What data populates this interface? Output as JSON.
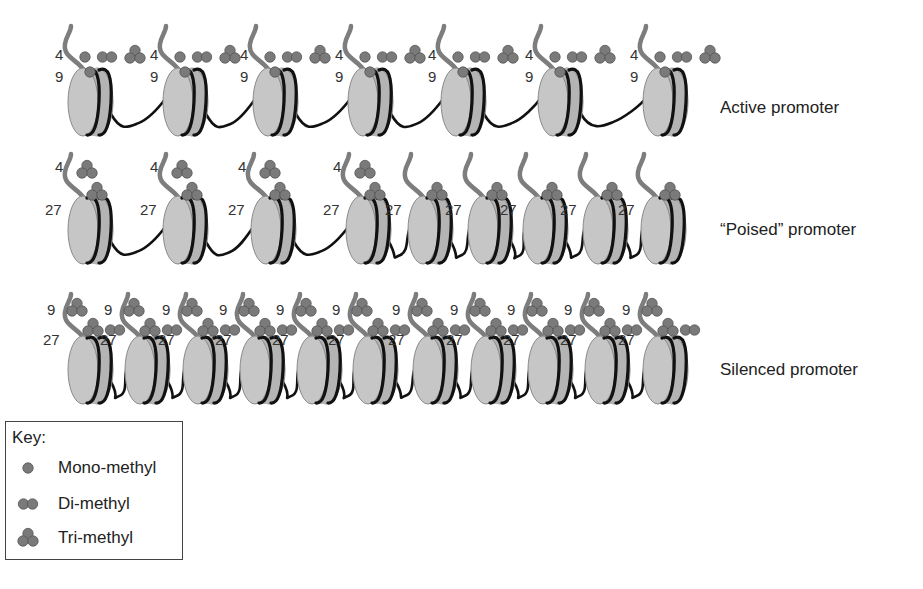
{
  "figure": {
    "colors": {
      "histone_fill": "#b4b4b4",
      "histone_edge": "#8a8a8a",
      "histone_face": "#c6c6c6",
      "dna": "#111111",
      "tail": "#7d7d7d",
      "methyl_fill": "#7a7a7a",
      "methyl_edge": "#555555",
      "text": "#222222"
    },
    "rows": [
      {
        "label": "Active promoter",
        "label_pos": [
          720,
          110
        ],
        "baseline_y": 100,
        "nucleosome_x": [
          85,
          180,
          270,
          365,
          458,
          555,
          660
        ],
        "marks": [
          {
            "residue": "4",
            "label_offset": [
              -30,
              -42
            ],
            "glyphs": [
              {
                "type": "mono",
                "dx": 0,
                "dy": -45
              },
              {
                "type": "di",
                "dx": 22,
                "dy": -45
              },
              {
                "type": "tri",
                "dx": 50,
                "dy": -47
              }
            ]
          },
          {
            "residue": "9",
            "label_offset": [
              -30,
              -20
            ],
            "glyphs": [
              {
                "type": "mono",
                "dx": 5,
                "dy": -30
              }
            ]
          }
        ]
      },
      {
        "label": "“Poised” promoter",
        "label_pos": [
          720,
          232
        ],
        "baseline_y": 228,
        "nucleosome_x": [
          85,
          180,
          268,
          363,
          425,
          485,
          540,
          600,
          658
        ],
        "marks_first_n": 4,
        "marks": [
          {
            "residue": "4",
            "label_offset": [
              -30,
              -58
            ],
            "glyphs": [
              {
                "type": "tri",
                "dx": 2,
                "dy": -60
              }
            ]
          },
          {
            "residue": "27",
            "label_offset": [
              -40,
              -15
            ],
            "glyphs": [
              {
                "type": "tri",
                "dx": 12,
                "dy": -38
              }
            ]
          }
        ],
        "marks_rest": [
          {
            "residue": "27",
            "label_offset": [
              -40,
              -15
            ],
            "glyphs": [
              {
                "type": "tri",
                "dx": 12,
                "dy": -38
              }
            ]
          }
        ]
      },
      {
        "label": "Silenced promoter",
        "label_pos": [
          720,
          372
        ],
        "baseline_y": 368,
        "nucleosome_x": [
          85,
          142,
          200,
          257,
          314,
          370,
          430,
          488,
          545,
          602,
          660
        ],
        "marks": [
          {
            "residue": "9",
            "label_offset": [
              -38,
              -55
            ],
            "glyphs": [
              {
                "type": "tri",
                "dx": -8,
                "dy": -62
              }
            ]
          },
          {
            "residue": "27",
            "label_offset": [
              -42,
              -25
            ],
            "glyphs": [
              {
                "type": "tri",
                "dx": 8,
                "dy": -42
              },
              {
                "type": "di",
                "dx": 30,
                "dy": -40
              }
            ]
          }
        ]
      }
    ],
    "key": {
      "title": "Key:",
      "items": [
        {
          "type": "mono",
          "label": "Mono-methyl"
        },
        {
          "type": "di",
          "label": "Di-methyl"
        },
        {
          "type": "tri",
          "label": "Tri-methyl"
        }
      ]
    }
  }
}
